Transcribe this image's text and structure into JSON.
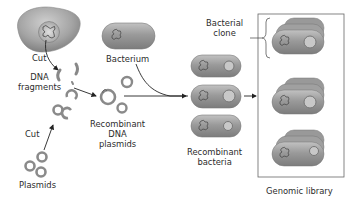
{
  "labels": {
    "cut_top": "Cut",
    "dna_fragments": "DNA\nfragments",
    "cut_bottom": "Cut",
    "plasmids": "Plasmids",
    "bacterium": "Bacterium",
    "recombinant_plasmids": "Recombinant\nDNA\nplasmids",
    "recombinant_bacteria": "Recombinant\nbacteria",
    "bacterial_clone": "Bacterial\nclone",
    "genomic_library": "Genomic library"
  },
  "colors": {
    "cell_fill": "#8e8e8e",
    "cell_light": "#bdbdbd",
    "outline": "#6a6a6a",
    "arrow": "#222222",
    "text": "#2b2b2b",
    "box": "#666666"
  }
}
